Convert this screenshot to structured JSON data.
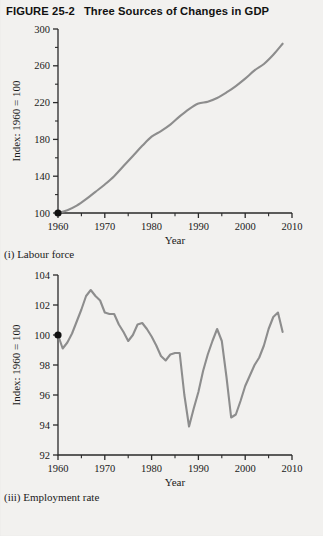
{
  "figure": {
    "number_label": "FIGURE 25-2",
    "title": "Three Sources of Changes in GDP"
  },
  "panels": [
    {
      "caption": "(i) Labour force",
      "xlabel": "Year",
      "ylabel": "Index: 1960 = 100"
    },
    {
      "caption": "(iii) Employment rate",
      "xlabel": "Year",
      "ylabel": "Index: 1960 = 100"
    }
  ],
  "colors": {
    "series_line": "#8d8d8d",
    "axis": "#2a2a2a",
    "origin_dot": "#111111",
    "page_background": "#f2f1ef"
  },
  "chart_data": [
    {
      "type": "line",
      "title": "(i) Labour force",
      "xlabel": "Year",
      "ylabel": "Index: 1960 = 100",
      "xlim": [
        1960,
        2010
      ],
      "ylim": [
        100,
        300
      ],
      "xticks": [
        1960,
        1970,
        1980,
        1990,
        2000,
        2010
      ],
      "xtick_labels": [
        "1960",
        "1970",
        "1980",
        "1990",
        "2000",
        "2010"
      ],
      "xminor_ticks": [
        1965,
        1975,
        1985,
        1995,
        2005
      ],
      "yticks": [
        100,
        140,
        180,
        220,
        260,
        300
      ],
      "ytick_labels": [
        "100",
        "140",
        "180",
        "220",
        "260",
        "300"
      ],
      "yminor_ticks": [
        120,
        160,
        200,
        240,
        280
      ],
      "grid": false,
      "legend": null,
      "marked_point": {
        "x": 1960,
        "y": 100
      },
      "x": [
        1960,
        1962,
        1964,
        1966,
        1968,
        1970,
        1972,
        1974,
        1976,
        1978,
        1980,
        1982,
        1984,
        1986,
        1988,
        1990,
        1992,
        1994,
        1996,
        1998,
        2000,
        2002,
        2004,
        2006,
        2008
      ],
      "values": [
        100,
        103,
        108,
        115,
        123,
        131,
        140,
        151,
        162,
        173,
        183,
        189,
        196,
        205,
        213,
        219,
        221,
        225,
        231,
        238,
        246,
        255,
        262,
        272,
        284
      ]
    },
    {
      "type": "line",
      "title": "(iii) Employment rate",
      "xlabel": "Year",
      "ylabel": "Index: 1960 = 100",
      "xlim": [
        1960,
        2010
      ],
      "ylim": [
        92,
        104
      ],
      "xticks": [
        1960,
        1970,
        1980,
        1990,
        2000,
        2010
      ],
      "xtick_labels": [
        "1960",
        "1970",
        "1980",
        "1990",
        "2000",
        "2010"
      ],
      "xminor_ticks": [
        1965,
        1975,
        1985,
        1995,
        2005
      ],
      "yticks": [
        92,
        94,
        96,
        98,
        100,
        102,
        104
      ],
      "ytick_labels": [
        "92",
        "94",
        "96",
        "98",
        "100",
        "102",
        "104"
      ],
      "grid": false,
      "legend": null,
      "marked_point": {
        "x": 1960,
        "y": 100
      },
      "x": [
        1960,
        1961,
        1962,
        1963,
        1964,
        1965,
        1966,
        1967,
        1968,
        1969,
        1970,
        1971,
        1972,
        1973,
        1974,
        1975,
        1976,
        1977,
        1978,
        1979,
        1980,
        1981,
        1982,
        1983,
        1984,
        1985,
        1986,
        1987,
        1988,
        1989,
        1990,
        1991,
        1992,
        1993,
        1994,
        1995,
        1996,
        1997,
        1998,
        1999,
        2000,
        2001,
        2002,
        2003,
        2004,
        2005,
        2006,
        2007,
        2008
      ],
      "values": [
        100,
        99.1,
        99.5,
        100.1,
        100.9,
        101.7,
        102.6,
        103.0,
        102.6,
        102.3,
        101.5,
        101.4,
        101.4,
        100.7,
        100.2,
        99.6,
        100.0,
        100.7,
        100.8,
        100.4,
        99.9,
        99.3,
        98.6,
        98.3,
        98.7,
        98.8,
        98.8,
        96.0,
        93.9,
        95.1,
        96.2,
        97.6,
        98.7,
        99.6,
        100.4,
        99.6,
        97.2,
        94.5,
        94.7,
        95.6,
        96.6,
        97.3,
        98.0,
        98.5,
        99.3,
        100.4,
        101.2,
        101.5,
        100.2
      ]
    }
  ]
}
